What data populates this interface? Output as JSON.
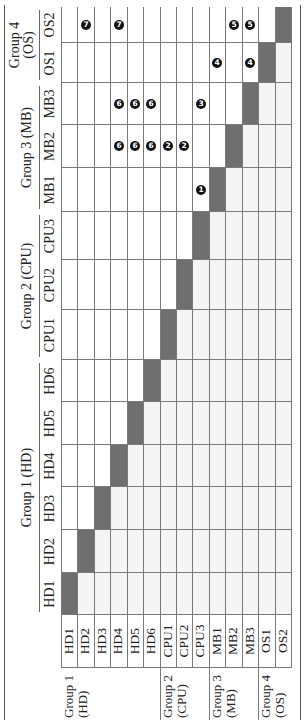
{
  "table": {
    "col_groups": [
      {
        "label": "Group 1 (HD)",
        "span": [
          "HD1",
          "HD6"
        ]
      },
      {
        "label": "Group 2 (CPU)",
        "span": [
          "CPU1",
          "CPU3"
        ]
      },
      {
        "label": "Group 3 (MB)",
        "span": [
          "MB1",
          "MB3"
        ]
      },
      {
        "label": "Group 4\n(OS)",
        "span": [
          "OS1",
          "OS2"
        ]
      }
    ],
    "columns": [
      "HD1",
      "HD2",
      "HD3",
      "HD4",
      "HD5",
      "HD6",
      "CPU1",
      "CPU2",
      "CPU3",
      "MB1",
      "MB2",
      "MB3",
      "OS1",
      "OS2"
    ],
    "row_groups": [
      {
        "label": "Group 1\n(HD)",
        "first_row": 0
      },
      {
        "label": "Group 2\n(CPU)",
        "first_row": 6
      },
      {
        "label": "Group 3\n(MB)",
        "first_row": 9
      },
      {
        "label": "Group 4\n(OS)",
        "first_row": 12
      }
    ],
    "rows": [
      "HD1",
      "HD2",
      "HD3",
      "HD4",
      "HD5",
      "HD6",
      "CPU1",
      "CPU2",
      "CPU3",
      "MB1",
      "MB2",
      "MB3",
      "OS1",
      "OS2"
    ],
    "markers": [
      {
        "row": "CPU3",
        "col": "MB1",
        "value": "1"
      },
      {
        "row": "CPU1",
        "col": "MB2",
        "value": "2"
      },
      {
        "row": "CPU2",
        "col": "MB2",
        "value": "2"
      },
      {
        "row": "CPU3",
        "col": "MB3",
        "value": "3"
      },
      {
        "row": "MB1",
        "col": "OS1",
        "value": "4"
      },
      {
        "row": "MB3",
        "col": "OS1",
        "value": "4"
      },
      {
        "row": "MB2",
        "col": "OS2",
        "value": "5"
      },
      {
        "row": "MB3",
        "col": "OS2",
        "value": "5"
      },
      {
        "row": "HD4",
        "col": "MB2",
        "value": "6"
      },
      {
        "row": "HD5",
        "col": "MB2",
        "value": "6"
      },
      {
        "row": "HD6",
        "col": "MB2",
        "value": "6"
      },
      {
        "row": "HD4",
        "col": "MB3",
        "value": "6"
      },
      {
        "row": "HD5",
        "col": "MB3",
        "value": "6"
      },
      {
        "row": "HD6",
        "col": "MB3",
        "value": "6"
      },
      {
        "row": "HD2",
        "col": "OS2",
        "value": "7"
      },
      {
        "row": "HD4",
        "col": "OS2",
        "value": "7"
      }
    ],
    "colors": {
      "diagonal": "#6f6f6f",
      "lower_triangle": "#f4f4f4",
      "upper_triangle": "#ffffff",
      "marker": "#111111"
    }
  }
}
